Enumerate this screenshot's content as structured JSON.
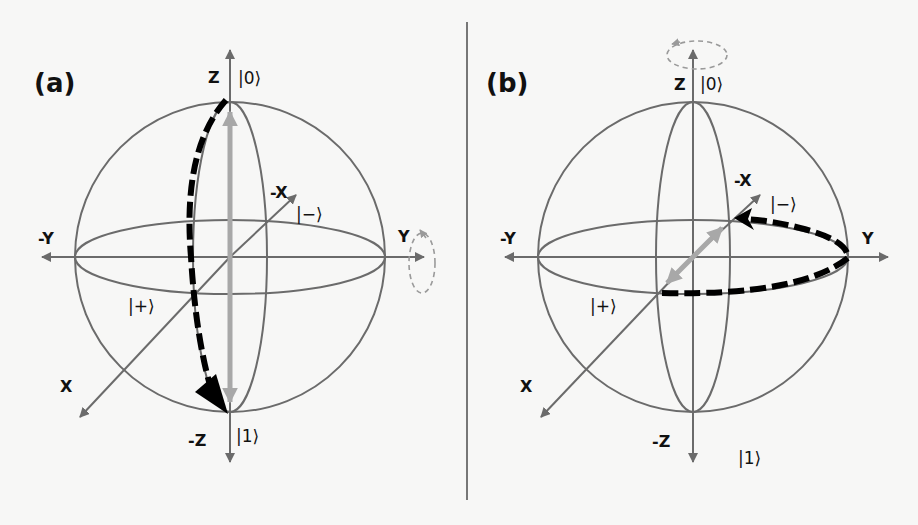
{
  "figure": {
    "divider_color": "#777777",
    "sphere_color": "#6b6b6b",
    "axis_color": "#6b6b6b",
    "state_arrow_color": "#a8a8a8",
    "path_color": "#000000",
    "rotation_hint_color": "#9a9a9a"
  },
  "panels": [
    {
      "id": "a",
      "label": "(a)",
      "axes": {
        "z": "Z",
        "neg_z": "-Z",
        "y": "Y",
        "neg_y": "-Y",
        "x": "X",
        "neg_x": "-X"
      },
      "kets": {
        "zero": "|0⟩",
        "one": "|1⟩",
        "plus": "|+⟩",
        "minus": "|−⟩"
      },
      "rotation_axis": "Y",
      "description": "Rotation about Y axis: state vector moves from |0⟩ to |1⟩ along dashed black path"
    },
    {
      "id": "b",
      "label": "(b)",
      "axes": {
        "z": "Z",
        "neg_z": "-Z",
        "y": "Y",
        "neg_y": "-Y",
        "x": "X",
        "neg_x": "-X"
      },
      "kets": {
        "zero": "|0⟩",
        "one": "|1⟩",
        "plus": "|+⟩",
        "minus": "|−⟩"
      },
      "rotation_axis": "Z",
      "description": "Rotation about Z axis: state vector moves from |+⟩ to |−⟩ along dashed black path in equatorial plane"
    }
  ]
}
